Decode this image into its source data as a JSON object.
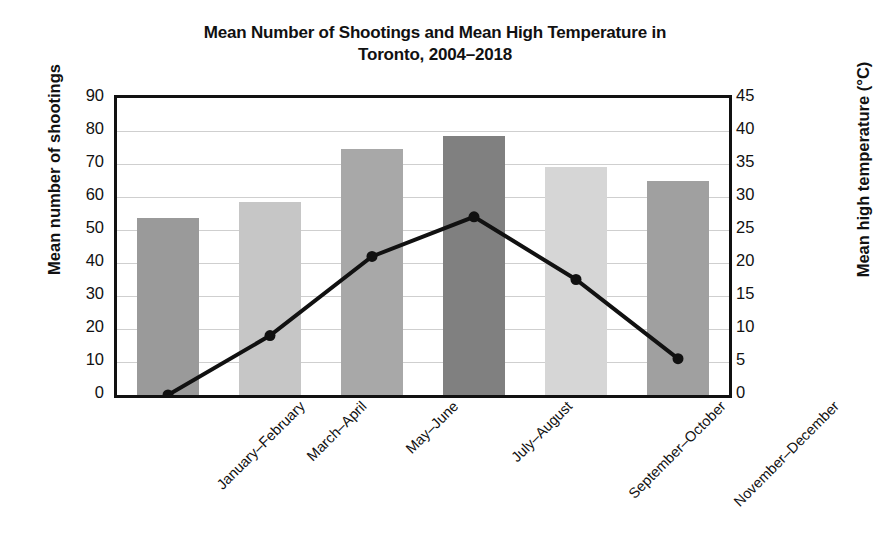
{
  "chart_data": {
    "type": "bar",
    "title": "Mean Number of Shootings and Mean High Temperature in Toronto, 2004–2018",
    "title_lines": [
      "Mean Number of Shootings and Mean High Temperature in",
      "Toronto, 2004–2018"
    ],
    "categories": [
      "January–February",
      "March–April",
      "May–June",
      "July–August",
      "September–October",
      "November–December"
    ],
    "xlabel": "",
    "series": [
      {
        "name": "Mean number of shootings",
        "type": "bar",
        "axis": "left",
        "values": [
          53.5,
          58.5,
          74.5,
          78.5,
          69.0,
          65.0
        ],
        "colors": [
          "#9a9a9a",
          "#c6c6c6",
          "#a8a8a8",
          "#808080",
          "#d6d6d6",
          "#a0a0a0"
        ]
      },
      {
        "name": "Mean high temperature (°C)",
        "type": "line",
        "axis": "right",
        "values": [
          0.0,
          9.0,
          21.0,
          27.0,
          17.5,
          5.5
        ],
        "color": "#111111",
        "marker": "circle"
      }
    ],
    "y_left": {
      "label": "Mean number of shootings",
      "ticks": [
        0,
        10,
        20,
        30,
        40,
        50,
        60,
        70,
        80,
        90
      ],
      "ylim": [
        0,
        90
      ]
    },
    "y_right": {
      "label": "Mean high temperature (°C)",
      "ticks": [
        0,
        5,
        10,
        15,
        20,
        25,
        30,
        35,
        40,
        45
      ],
      "ylim": [
        0,
        45
      ]
    },
    "grid": true,
    "legend": "none"
  }
}
